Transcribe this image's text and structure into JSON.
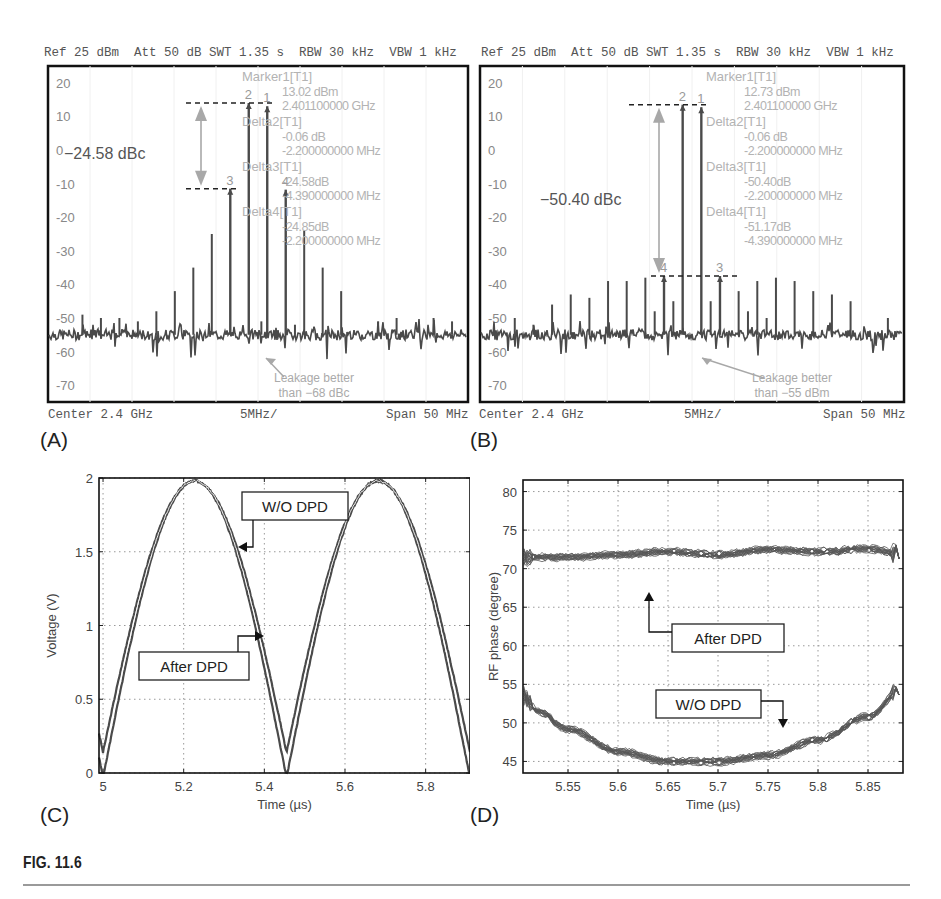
{
  "figure": {
    "caption": "FIG. 11.6",
    "panel_labels": [
      "(A)",
      "(B)",
      "(C)",
      "(D)"
    ]
  },
  "colors": {
    "trace": "#4a4a4a",
    "annotation_gray": "#a8a8a8",
    "marker_text": "#b3b3b3",
    "frame": "#111111",
    "grid": "#999999"
  },
  "chart_data": [
    {
      "id": "A",
      "type": "line",
      "title": "Spectrum without DPD",
      "header": {
        "ref": "Ref 25 dBm",
        "att": "Att 50 dB",
        "swt": "SWT 1.35 s",
        "rbw": "RBW 30 kHz",
        "vbw": "VBW 1 kHz"
      },
      "footer": {
        "center": "Center 2.4 GHz",
        "div": "5MHz/",
        "span": "Span 50 MHz"
      },
      "ylim": [
        -75,
        25
      ],
      "yticks": [
        20,
        10,
        0,
        -10,
        -20,
        -30,
        -40,
        -50,
        -60,
        -70
      ],
      "xlim": [
        2.375,
        2.425
      ],
      "xlabel": "Frequency (GHz)",
      "ylabel": "Power (dBm)",
      "noise_floor": -55,
      "tones": [
        {
          "f": 2.3989,
          "p": 14.0,
          "label": "2"
        },
        {
          "f": 2.4011,
          "p": 13.02,
          "label": "1"
        },
        {
          "f": 2.3967,
          "p": -11.5,
          "label": "3"
        },
        {
          "f": 2.4033,
          "p": -11.8,
          "label": "4"
        },
        {
          "f": 2.3945,
          "p": -25
        },
        {
          "f": 2.4055,
          "p": -24
        },
        {
          "f": 2.3923,
          "p": -35
        },
        {
          "f": 2.4077,
          "p": -35
        },
        {
          "f": 2.3901,
          "p": -42
        },
        {
          "f": 2.4099,
          "p": -42
        },
        {
          "f": 2.3879,
          "p": -48
        },
        {
          "f": 2.3857,
          "p": -51
        },
        {
          "f": 2.3835,
          "p": -50
        },
        {
          "f": 2.3813,
          "p": -50
        },
        {
          "f": 2.3791,
          "p": -49
        },
        {
          "f": 2.4004,
          "p": -51
        },
        {
          "f": 2.4044,
          "p": -52
        },
        {
          "f": 2.4143,
          "p": -51
        },
        {
          "f": 2.4165,
          "p": -50
        },
        {
          "f": 2.4209,
          "p": -50
        },
        {
          "f": 2.4231,
          "p": -51
        }
      ],
      "marker_table": [
        {
          "name": "Marker1[T1]",
          "value": "13.02 dBm",
          "pos": "2.401100000 GHz"
        },
        {
          "name": "Delta2[T1]",
          "value": "-0.06 dB",
          "pos": "-2.200000000 MHz"
        },
        {
          "name": "Delta3[T1]",
          "value": "-24.58dB",
          "pos": "-4.390000000 MHz"
        },
        {
          "name": "Delta4[T1]",
          "value": "-24.85dB",
          "pos": "-2.200000000 MHz"
        }
      ],
      "annotations": {
        "dbc_label": "−24.58 dBc",
        "leakage_line1": "Leakage better",
        "leakage_line2": "than −68 dBc",
        "top_ref_db": 14,
        "bottom_ref_db": -11.5
      }
    },
    {
      "id": "B",
      "type": "line",
      "title": "Spectrum with DPD",
      "header": {
        "ref": "Ref 25 dBm",
        "att": "Att 50 dB",
        "swt": "SWT 1.35 s",
        "rbw": "RBW 30 kHz",
        "vbw": "VBW 1 kHz"
      },
      "footer": {
        "center": "Center 2.4 GHz",
        "div": "5MHz/",
        "span": "Span 50 MHz"
      },
      "ylim": [
        -75,
        25
      ],
      "yticks": [
        20,
        10,
        0,
        -10,
        -20,
        -30,
        -40,
        -50,
        -60,
        -70
      ],
      "xlim": [
        2.375,
        2.425
      ],
      "xlabel": "Frequency (GHz)",
      "ylabel": "Power (dBm)",
      "noise_floor": -55,
      "tones": [
        {
          "f": 2.3989,
          "p": 13.5,
          "label": "2"
        },
        {
          "f": 2.4011,
          "p": 12.73,
          "label": "1"
        },
        {
          "f": 2.3967,
          "p": -37.5,
          "label": "4"
        },
        {
          "f": 2.4033,
          "p": -37.5,
          "label": "3"
        },
        {
          "f": 2.3978,
          "p": -45
        },
        {
          "f": 2.4022,
          "p": -45
        },
        {
          "f": 2.3956,
          "p": -48
        },
        {
          "f": 2.3945,
          "p": -38
        },
        {
          "f": 2.4055,
          "p": -42
        },
        {
          "f": 2.3923,
          "p": -39
        },
        {
          "f": 2.4077,
          "p": -39
        },
        {
          "f": 2.3901,
          "p": -39
        },
        {
          "f": 2.4099,
          "p": -38
        },
        {
          "f": 2.3879,
          "p": -44
        },
        {
          "f": 2.4121,
          "p": -39
        },
        {
          "f": 2.3857,
          "p": -43
        },
        {
          "f": 2.4143,
          "p": -42
        },
        {
          "f": 2.3835,
          "p": -46
        },
        {
          "f": 2.4165,
          "p": -43
        },
        {
          "f": 2.4187,
          "p": -45
        },
        {
          "f": 2.3813,
          "p": -52
        },
        {
          "f": 2.3791,
          "p": -50
        },
        {
          "f": 2.4066,
          "p": -48
        },
        {
          "f": 2.4088,
          "p": -50
        },
        {
          "f": 2.4231,
          "p": -50
        }
      ],
      "marker_table": [
        {
          "name": "Marker1[T1]",
          "value": "12.73 dBm",
          "pos": "2.401100000 GHz"
        },
        {
          "name": "Delta2[T1]",
          "value": "-0.06 dB",
          "pos": "-2.200000000 MHz"
        },
        {
          "name": "Delta3[T1]",
          "value": "-50.40dB",
          "pos": "-2.200000000 MHz"
        },
        {
          "name": "Delta4[T1]",
          "value": "-51.17dB",
          "pos": "-4.390000000 MHz"
        }
      ],
      "annotations": {
        "dbc_label": "−50.40 dBc",
        "leakage_line1": "Leakage better",
        "leakage_line2": "than −55 dBm",
        "top_ref_db": 13.5,
        "bottom_ref_db": -37.5
      }
    },
    {
      "id": "C",
      "type": "line",
      "title": "",
      "xlabel": "Time (µs)",
      "ylabel": "Voltage (V)",
      "xlim": [
        4.99,
        5.91
      ],
      "ylim": [
        0,
        2
      ],
      "xticks": [
        5,
        5.2,
        5.4,
        5.6,
        5.8
      ],
      "xtick_labels": [
        "5",
        "5.2",
        "5.4",
        "5.6",
        "5.8"
      ],
      "yticks": [
        0,
        0.5,
        1,
        1.5,
        2
      ],
      "ytick_labels": [
        "0",
        "0.5",
        "1",
        "1.5",
        "2"
      ],
      "grid": true,
      "period_us": 0.455,
      "zero_crossings_us": [
        5.0,
        5.455,
        5.91
      ],
      "peak_v": 1.98,
      "series": [
        {
          "name": "W/O DPD",
          "shape": "full-wave rectified sine, slightly wider lobes"
        },
        {
          "name": "After DPD",
          "shape": "full-wave rectified sine, slightly narrower lobes"
        }
      ],
      "labels": {
        "wo_dpd": "W/O DPD",
        "after_dpd": "After DPD"
      }
    },
    {
      "id": "D",
      "type": "line",
      "title": "",
      "xlabel": "Time (µs)",
      "ylabel": "RF phase (degree)",
      "xlim": [
        5.505,
        5.885
      ],
      "ylim": [
        43.5,
        81.5
      ],
      "xticks": [
        5.55,
        5.6,
        5.65,
        5.7,
        5.75,
        5.8,
        5.85
      ],
      "xtick_labels": [
        "5.55",
        "5.6",
        "5.65",
        "5.7",
        "5.75",
        "5.8",
        "5.85"
      ],
      "yticks": [
        45,
        50,
        55,
        60,
        65,
        70,
        75,
        80
      ],
      "ytick_labels": [
        "45",
        "50",
        "55",
        "60",
        "65",
        "70",
        "75",
        "80"
      ],
      "grid": true,
      "series": [
        {
          "name": "After DPD",
          "x": [
            5.505,
            5.55,
            5.6,
            5.65,
            5.7,
            5.75,
            5.8,
            5.85,
            5.88
          ],
          "y": [
            71.5,
            71.5,
            71.8,
            72.2,
            71.8,
            72.5,
            72.2,
            72.6,
            72.0
          ]
        },
        {
          "name": "W/O DPD",
          "x": [
            5.505,
            5.52,
            5.55,
            5.6,
            5.65,
            5.7,
            5.75,
            5.8,
            5.85,
            5.885
          ],
          "y": [
            53.5,
            51.5,
            49.2,
            46.3,
            45.0,
            45.0,
            45.8,
            47.8,
            50.8,
            54.5
          ]
        }
      ],
      "labels": {
        "wo_dpd": "W/O DPD",
        "after_dpd": "After DPD"
      }
    }
  ]
}
